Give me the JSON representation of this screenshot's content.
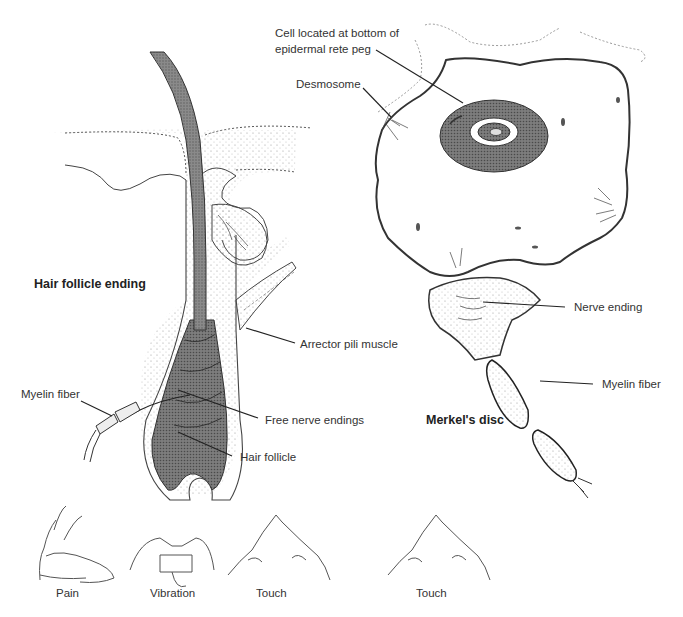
{
  "figure": {
    "panels": {
      "hair_follicle": {
        "title": "Hair follicle ending",
        "labels": {
          "arrector_pili": "Arrector pili muscle",
          "myelin_fiber": "Myelin fiber",
          "free_nerve_endings": "Free nerve endings",
          "hair_follicle": "Hair follicle"
        }
      },
      "merkel": {
        "title": "Merkel's disc",
        "labels": {
          "cell_line1": "Cell located at bottom of",
          "cell_line2": "epidermal rete peg",
          "desmosome": "Desmosome",
          "nerve_ending": "Nerve ending",
          "myelin_fiber": "Myelin fiber"
        }
      }
    },
    "sensations": [
      {
        "label": "Pain"
      },
      {
        "label": "Vibration"
      },
      {
        "label": "Touch"
      },
      {
        "label": "Touch"
      }
    ],
    "colors": {
      "ink": "#2a2a2a",
      "stipple": "#bdbdbd",
      "shaft": "#6e6e6e",
      "background": "#ffffff"
    }
  }
}
